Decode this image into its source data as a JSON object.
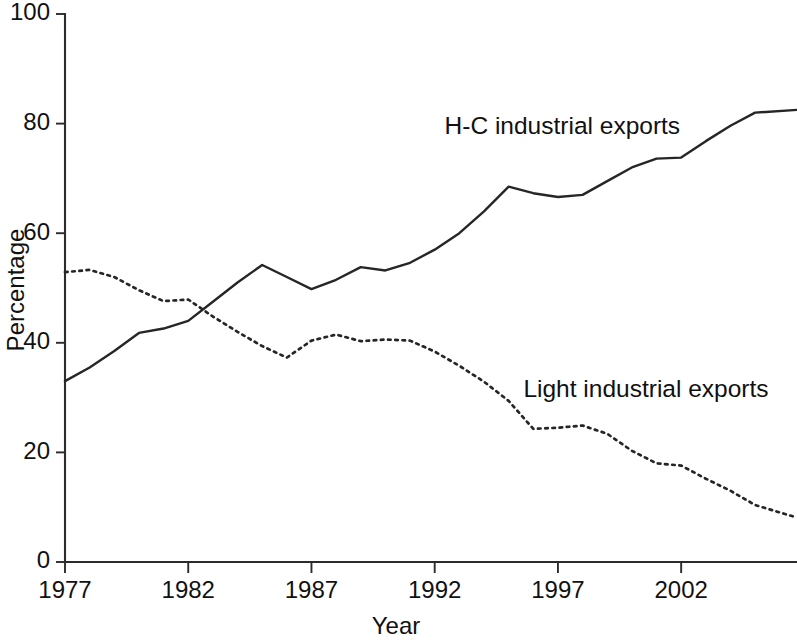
{
  "chart_data": {
    "type": "line",
    "title": "",
    "subtitle": "",
    "xlabel": "Year",
    "ylabel": "Percentage",
    "xlim": [
      1977,
      2006.7
    ],
    "ylim": [
      0,
      100
    ],
    "grid": false,
    "legend_position": "inline-annotation",
    "x_ticks": [
      1977,
      1982,
      1987,
      1992,
      1997,
      2002
    ],
    "x_tick_labels": [
      "1977",
      "1982",
      "1987",
      "1992",
      "1997",
      "2002"
    ],
    "y_ticks": [
      0,
      20,
      40,
      60,
      80,
      100
    ],
    "y_tick_labels": [
      "0",
      "20",
      "40",
      "60",
      "80",
      "100"
    ],
    "x": [
      1977,
      1978,
      1979,
      1980,
      1981,
      1982,
      1983,
      1984,
      1985,
      1986,
      1987,
      1988,
      1989,
      1990,
      1991,
      1992,
      1993,
      1994,
      1995,
      1996,
      1997,
      1998,
      1999,
      2000,
      2001,
      2002,
      2003,
      2004,
      2005,
      2006.7
    ],
    "series": [
      {
        "name": "H-C industrial exports",
        "style": "solid",
        "color": "#262626",
        "label_x": 1992.4,
        "label_y": 79.2,
        "values": [
          33.0,
          35.5,
          38.5,
          41.8,
          42.6,
          44.0,
          47.5,
          51.0,
          54.2,
          52.0,
          49.8,
          51.5,
          53.8,
          53.2,
          54.6,
          57.0,
          60.0,
          64.0,
          68.5,
          67.3,
          66.6,
          67.0,
          69.5,
          72.0,
          73.6,
          73.8,
          76.8,
          79.6,
          82.0,
          82.5
        ]
      },
      {
        "name": "Light industrial exports",
        "style": "dotted",
        "color": "#262626",
        "label_x": 1995.6,
        "label_y": 31.2,
        "values": [
          52.9,
          53.3,
          52.0,
          49.6,
          47.6,
          47.9,
          44.8,
          42.0,
          39.4,
          37.3,
          40.4,
          41.5,
          40.3,
          40.6,
          40.4,
          38.4,
          35.8,
          32.9,
          29.4,
          24.3,
          24.5,
          24.9,
          23.4,
          20.3,
          18.0,
          17.6,
          15.2,
          13.0,
          10.4,
          8.1
        ]
      }
    ]
  }
}
